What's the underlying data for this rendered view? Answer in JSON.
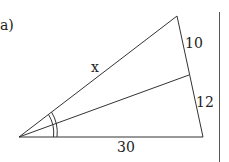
{
  "part_label": "a)",
  "labels": {
    "hypotenuse": "x",
    "upper_segment": "10",
    "lower_segment": "12",
    "base": "30"
  },
  "colors": {
    "stroke": "#333333",
    "text": "#222222"
  }
}
